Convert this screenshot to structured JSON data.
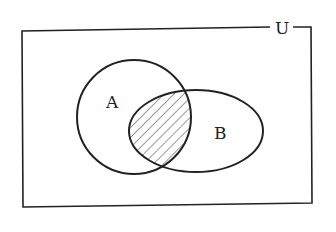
{
  "diagram": {
    "type": "venn",
    "universe_label": "U",
    "sets": [
      {
        "label": "A"
      },
      {
        "label": "B"
      }
    ],
    "shaded_region": "A ∩ B",
    "colors": {
      "stroke": "#222222",
      "background": "#ffffff",
      "hatch": "#333333"
    }
  }
}
